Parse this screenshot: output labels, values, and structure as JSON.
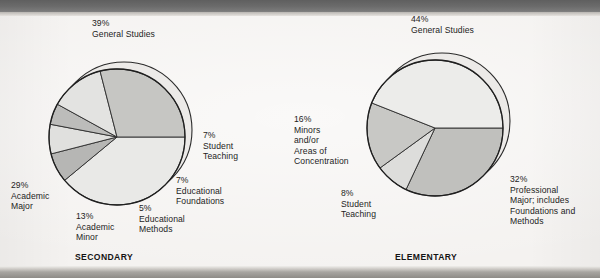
{
  "figure": {
    "kind": "two-pie-figure",
    "background": "#f4f2f0",
    "ink": "#1d1d1d"
  },
  "charts": [
    {
      "id": "secondary",
      "caption": "SECONDARY",
      "center": {
        "x": 117,
        "y": 137
      },
      "radius": 68,
      "shadow_offset": {
        "x": 7,
        "y": -7
      },
      "start_angle_deg": 0,
      "slices": [
        {
          "label": "General Studies",
          "pct_label": "39%",
          "value": 39,
          "color": "#e9e9e7"
        },
        {
          "label": "Student Teaching",
          "pct_label": "7%",
          "value": 7,
          "color": "#b6b6b4"
        },
        {
          "label": "Educational Foundations",
          "pct_label": "7%",
          "value": 7,
          "color": "#e0e0de"
        },
        {
          "label": "Educational Methods",
          "pct_label": "5%",
          "value": 5,
          "color": "#bcbcba"
        },
        {
          "label": "Academic Minor",
          "pct_label": "13%",
          "value": 13,
          "color": "#e3e3e1"
        },
        {
          "label": "Academic Major",
          "pct_label": "29%",
          "value": 29,
          "color": "#c6c6c3"
        }
      ],
      "labels": [
        {
          "name": "general-studies",
          "text": "39%\nGeneral Studies",
          "x": 92,
          "y": 18,
          "align": "left"
        },
        {
          "name": "student-teaching",
          "text": "7%\nStudent\nTeaching",
          "x": 203,
          "y": 130,
          "align": "left"
        },
        {
          "name": "educational-foundations",
          "text": "7%\nEducational\nFoundations",
          "x": 176,
          "y": 175,
          "align": "left"
        },
        {
          "name": "educational-methods",
          "text": "5%\nEducational\nMethods",
          "x": 139,
          "y": 203,
          "align": "left"
        },
        {
          "name": "academic-minor",
          "text": "13%\nAcademic\nMinor",
          "x": 76,
          "y": 211,
          "align": "left"
        },
        {
          "name": "academic-major",
          "text": "29%\nAcademic\nMajor",
          "x": 11,
          "y": 180,
          "align": "left"
        }
      ],
      "caption_pos": {
        "x": 75,
        "y": 252
      }
    },
    {
      "id": "elementary",
      "caption": "ELEMENTARY",
      "center": {
        "x": 435,
        "y": 128
      },
      "radius": 68,
      "shadow_offset": {
        "x": 7,
        "y": -7
      },
      "start_angle_deg": 0,
      "slices": [
        {
          "label": "Professional Major; includes Foundations and Methods",
          "pct_label": "32%",
          "value": 32,
          "color": "#c0c0bd"
        },
        {
          "label": "Student Teaching",
          "pct_label": "8%",
          "value": 8,
          "color": "#dddddb"
        },
        {
          "label": "Minors and/or Areas of Concentration",
          "pct_label": "16%",
          "value": 16,
          "color": "#c8c8c5"
        },
        {
          "label": "General Studies",
          "pct_label": "44%",
          "value": 44,
          "color": "#ececea"
        }
      ],
      "labels": [
        {
          "name": "general-studies",
          "text": "44%\nGeneral Studies",
          "x": 411,
          "y": 14,
          "align": "left"
        },
        {
          "name": "professional-major",
          "text": "32%\nProfessional\nMajor; includes\nFoundations and\nMethods",
          "x": 510,
          "y": 174,
          "align": "left"
        },
        {
          "name": "student-teaching",
          "text": "8%\nStudent\nTeaching",
          "x": 341,
          "y": 188,
          "align": "left"
        },
        {
          "name": "minors-areas",
          "text": "16%\nMinors\nand/or\nAreas of\nConcentration",
          "x": 294,
          "y": 114,
          "align": "left"
        }
      ],
      "caption_pos": {
        "x": 395,
        "y": 252
      }
    }
  ],
  "chart_data": [
    {
      "type": "pie",
      "title": "SECONDARY",
      "categories": [
        "General Studies",
        "Student Teaching",
        "Educational Foundations",
        "Educational Methods",
        "Academic Minor",
        "Academic Major"
      ],
      "values": [
        39,
        7,
        7,
        5,
        13,
        29
      ],
      "value_labels": [
        "39%",
        "7%",
        "7%",
        "5%",
        "13%",
        "29%"
      ],
      "unit": "percent",
      "legend": "in-place labels around pie",
      "grid": false
    },
    {
      "type": "pie",
      "title": "ELEMENTARY",
      "categories": [
        "General Studies",
        "Professional Major; includes Foundations and Methods",
        "Student Teaching",
        "Minors and/or Areas of Concentration"
      ],
      "values": [
        44,
        32,
        8,
        16
      ],
      "value_labels": [
        "44%",
        "32%",
        "8%",
        "16%"
      ],
      "unit": "percent",
      "legend": "in-place labels around pie",
      "grid": false
    }
  ]
}
